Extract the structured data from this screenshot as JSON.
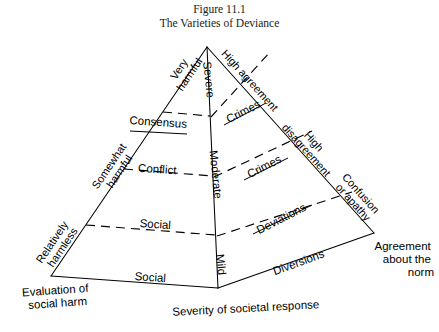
{
  "figure": {
    "number_line": "Figure 11.1",
    "title_line": "The Varieties of Deviance"
  },
  "diagram": {
    "type": "pyramid",
    "apex_label_left": "Very harmful",
    "apex_label_right": "High agreement"
  },
  "center_axis": {
    "name": "severity-of-societal-response",
    "levels": [
      {
        "label": "Severe"
      },
      {
        "label": "Moderate"
      },
      {
        "label": "Mild"
      }
    ]
  },
  "left_edge": {
    "name": "evaluation-of-social-harm",
    "levels": [
      {
        "label": "Very harmful"
      },
      {
        "label": "Somewhat harmful"
      },
      {
        "label": "Relatively harmless"
      }
    ]
  },
  "right_edge": {
    "name": "agreement-about-the-norm",
    "levels": [
      {
        "label": "High agreement"
      },
      {
        "label": "High disagreement"
      },
      {
        "label": "Confusion or apathy"
      }
    ]
  },
  "left_face_tiers": [
    {
      "label": "Consensus"
    },
    {
      "label": "Conflict"
    },
    {
      "label": "Social"
    },
    {
      "label": "Social"
    }
  ],
  "right_face_tiers": [
    {
      "label": "Crimes"
    },
    {
      "label": "Crimes"
    },
    {
      "label": "Deviations"
    },
    {
      "label": "Diversions"
    }
  ],
  "axis_labels": {
    "bottom_left_line1": "Evaluation of",
    "bottom_left_line2": "social harm",
    "bottom_center": "Severity of societal response",
    "bottom_right_line1": "Agreement",
    "bottom_right_line2": "about the",
    "bottom_right_line3": "norm"
  },
  "colors": {
    "ink": "#000000",
    "background": "#ffffff"
  }
}
